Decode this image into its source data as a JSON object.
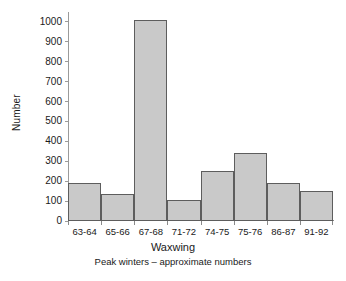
{
  "chart_data": {
    "type": "bar",
    "title": "",
    "xlabel": "Waxwing",
    "subtitle": "Peak winters – approximate numbers",
    "ylabel": "Number",
    "categories": [
      "63-64",
      "65-66",
      "67-68",
      "71-72",
      "74-75",
      "75-76",
      "86-87",
      "91-92"
    ],
    "values": [
      190,
      135,
      1010,
      105,
      250,
      340,
      190,
      150
    ],
    "ylim": [
      0,
      1050
    ],
    "yticks": [
      0,
      100,
      200,
      300,
      400,
      500,
      600,
      700,
      800,
      900,
      1000
    ],
    "ytick_labels": [
      "0",
      "100",
      "200",
      "300",
      "400",
      "500",
      "600",
      "700",
      "800",
      "900",
      "1000"
    ],
    "grid": false,
    "legend": null,
    "bar_fill_color": "#c9c9c9",
    "bar_border_color": "#5d5d5d",
    "background_color": "#ffffff",
    "axis_color": "#8a8a8a",
    "text_color": "#1a1a1a"
  }
}
